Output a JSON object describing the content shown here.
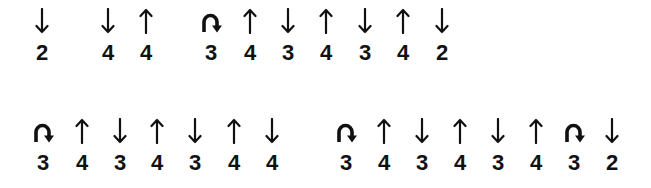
{
  "rows": [
    {
      "arrow_top": 6,
      "cells": [
        {
          "x": 42,
          "icon": "arrow-down",
          "value": "2"
        },
        {
          "x": 108,
          "icon": "arrow-down",
          "value": "4"
        },
        {
          "x": 146,
          "icon": "arrow-up",
          "value": "4"
        },
        {
          "x": 211,
          "icon": "u-turn",
          "value": "3"
        },
        {
          "x": 250,
          "icon": "arrow-up",
          "value": "4"
        },
        {
          "x": 288,
          "icon": "arrow-down",
          "value": "3"
        },
        {
          "x": 326,
          "icon": "arrow-up",
          "value": "4"
        },
        {
          "x": 365,
          "icon": "arrow-down",
          "value": "3"
        },
        {
          "x": 403,
          "icon": "arrow-up",
          "value": "4"
        },
        {
          "x": 442,
          "icon": "arrow-down",
          "value": "2"
        }
      ]
    },
    {
      "arrow_top": 116,
      "cells": [
        {
          "x": 43,
          "icon": "u-turn",
          "value": "3"
        },
        {
          "x": 82,
          "icon": "arrow-up",
          "value": "4"
        },
        {
          "x": 120,
          "icon": "arrow-down",
          "value": "3"
        },
        {
          "x": 157,
          "icon": "arrow-up",
          "value": "4"
        },
        {
          "x": 195,
          "icon": "arrow-down",
          "value": "3"
        },
        {
          "x": 234,
          "icon": "arrow-up",
          "value": "4"
        },
        {
          "x": 272,
          "icon": "arrow-down",
          "value": "4"
        },
        {
          "x": 346,
          "icon": "u-turn",
          "value": "3"
        },
        {
          "x": 384,
          "icon": "arrow-up",
          "value": "4"
        },
        {
          "x": 422,
          "icon": "arrow-down",
          "value": "3"
        },
        {
          "x": 460,
          "icon": "arrow-up",
          "value": "4"
        },
        {
          "x": 498,
          "icon": "arrow-down",
          "value": "3"
        },
        {
          "x": 536,
          "icon": "arrow-up",
          "value": "4"
        },
        {
          "x": 574,
          "icon": "u-turn",
          "value": "3"
        },
        {
          "x": 612,
          "icon": "arrow-down",
          "value": "2"
        }
      ]
    }
  ]
}
